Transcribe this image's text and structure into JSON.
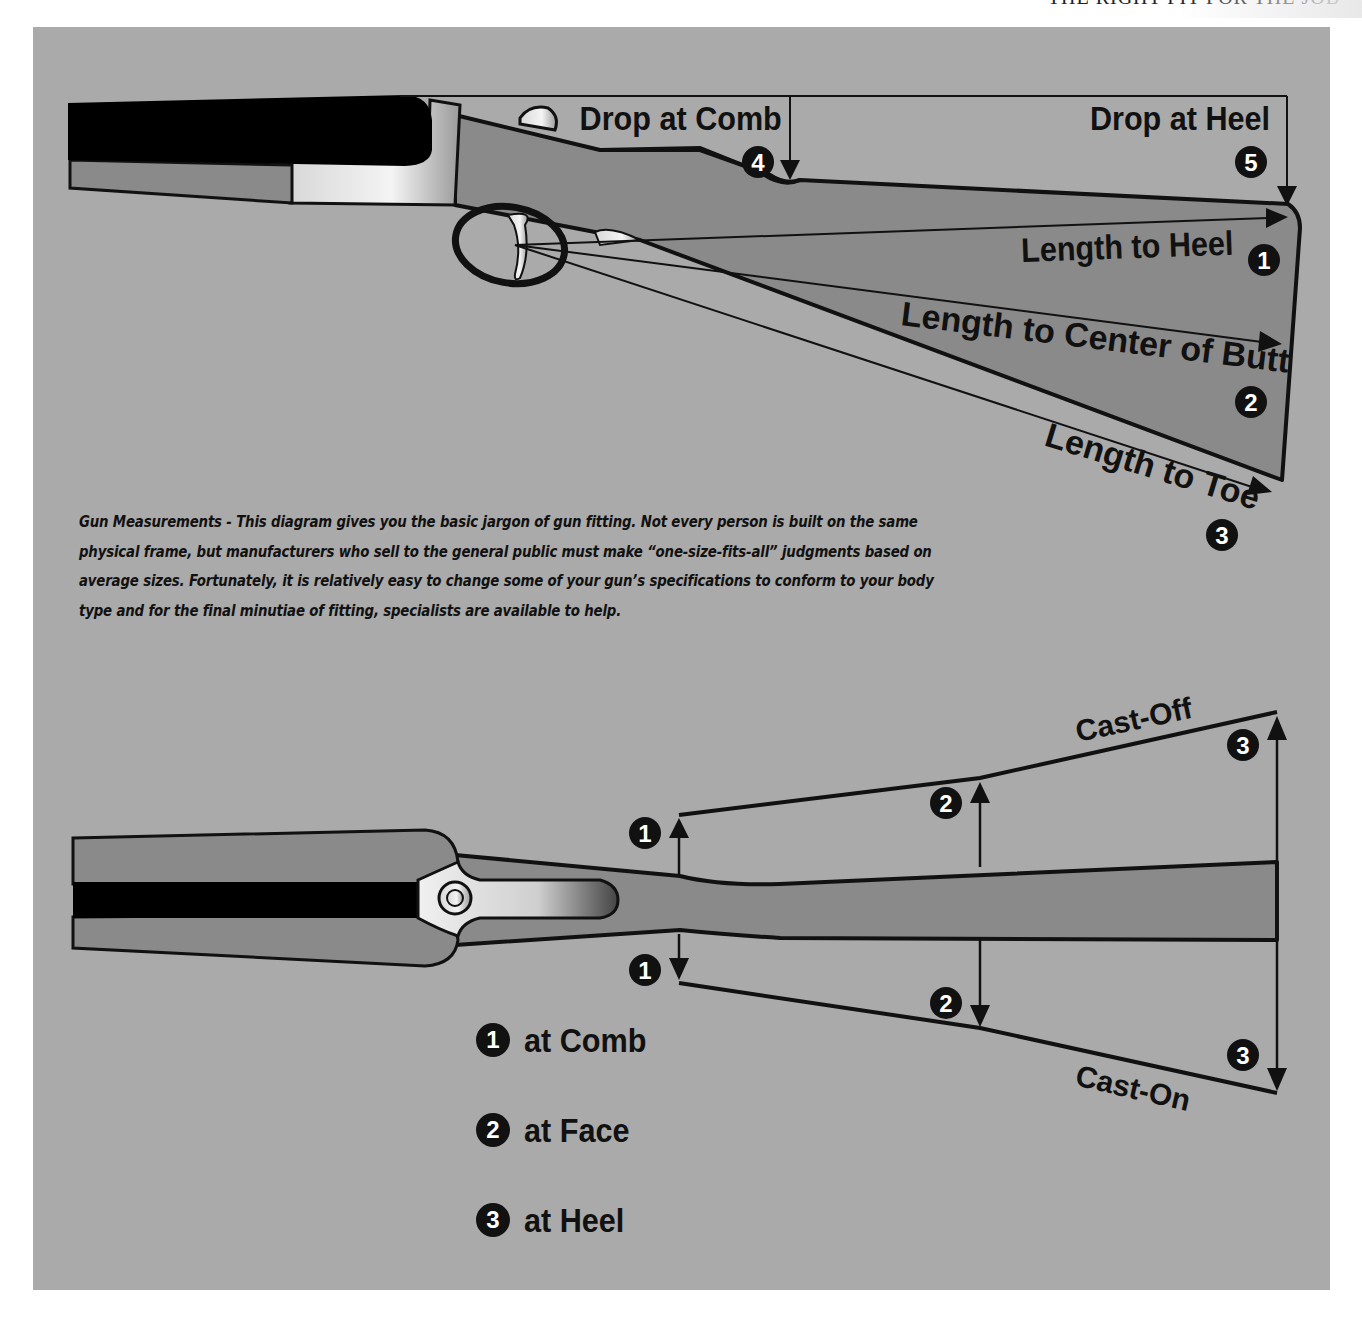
{
  "header": {
    "title": "THE RIGHT FIT FOR THE JOB"
  },
  "side_view": {
    "labels": {
      "drop_at_comb": "Drop at Comb",
      "drop_at_heel": "Drop at Heel",
      "length_to_heel": "Length to Heel",
      "length_to_center_of_butt": "Length to Center of Butt",
      "length_to_toe": "Length to Toe"
    },
    "markers": {
      "drop_at_comb": "4",
      "drop_at_heel": "5",
      "length_to_heel": "1",
      "length_to_center_of_butt": "2",
      "length_to_toe": "3"
    }
  },
  "caption": {
    "text": "Gun Measurements - This diagram gives you the basic jargon of gun fitting. Not every person is built on the same physical frame, but manufacturers who sell to the general public must make “one-size-fits-all” judgments based on average sizes. Fortunately, it is relatively easy to change some of your gun’s specifications to conform to your body type and for the final minutiae of fitting, specialists are available to help."
  },
  "top_view": {
    "labels": {
      "cast_off": "Cast-Off",
      "cast_on": "Cast-On"
    },
    "markers": {
      "comb_up": "1",
      "face_up": "2",
      "heel_up": "3",
      "comb_down": "1",
      "face_down": "2",
      "heel_down": "3"
    }
  },
  "legend": {
    "items": [
      {
        "number": "1",
        "label": "at Comb"
      },
      {
        "number": "2",
        "label": "at Face"
      },
      {
        "number": "3",
        "label": "at Heel"
      }
    ]
  },
  "colors": {
    "background": "#aaaaaa",
    "stock": "#888888",
    "barrel": "#000000",
    "outline": "#111111",
    "page": "#ffffff"
  }
}
